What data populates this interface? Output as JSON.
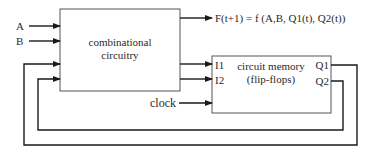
{
  "diagram": {
    "inputs": {
      "a": "A",
      "b": "B"
    },
    "combinational_block": {
      "line1": "combinational",
      "line2": "circuitry"
    },
    "output_equation": "F(t+1) = f (A,B, Q1(t), Q2(t))",
    "memory_block": {
      "line1": "circuit memory",
      "line2": "(flip-flops)",
      "input1": "I1",
      "input2": "I2",
      "output1": "Q1",
      "output2": "Q2"
    },
    "clock": "clock"
  }
}
